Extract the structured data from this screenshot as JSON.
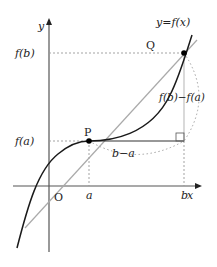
{
  "diagram": {
    "type": "mean-value-theorem-graph",
    "axes": {
      "x_label": "x",
      "y_label": "y",
      "origin_label": "O"
    },
    "curve_label": "y=f(x)",
    "points": [
      {
        "label": "P",
        "x_label": "a",
        "y_label": "f(a)"
      },
      {
        "label": "Q",
        "x_label": "b",
        "y_label": "f(b)"
      }
    ],
    "horizontal_difference_label": "b−a",
    "vertical_difference_label": "f(b)−f(a)",
    "colors": {
      "axis": "#555555",
      "curve": "#1a1a1a",
      "secant": "#aaaaaa",
      "guides": "#999999",
      "point": "#000000"
    }
  }
}
